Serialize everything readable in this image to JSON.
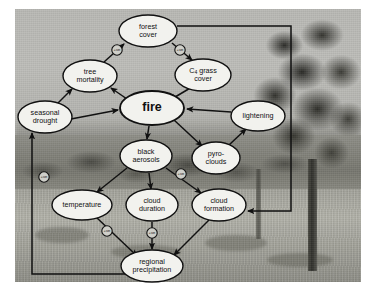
{
  "figure": {
    "kind": "causal-loop-diagram",
    "background_scene": "savanna grassland with tree",
    "central_node": "fire"
  },
  "colors": {
    "node_fill": "#f2f2ee",
    "node_stroke": "#111111",
    "arrow": "#111111",
    "badge_fill": "#cfcfc9",
    "text": "#101010",
    "photo_base": "#a9a9a6"
  },
  "nodes": [
    {
      "id": "forest_cover",
      "label_lines": [
        "forest",
        "cover"
      ],
      "cx": 148,
      "cy": 31,
      "rx": 29,
      "ry": 16,
      "font": 7.2,
      "bold": false
    },
    {
      "id": "c4_grass_cover",
      "label_lines": [
        "C₄ grass",
        "cover"
      ],
      "cx": 203,
      "cy": 75,
      "rx": 28,
      "ry": 16,
      "font": 7.2,
      "bold": false
    },
    {
      "id": "tree_mortality",
      "label_lines": [
        "tree",
        "mortality"
      ],
      "cx": 90,
      "cy": 76,
      "rx": 27,
      "ry": 16,
      "font": 7.2,
      "bold": false
    },
    {
      "id": "fire",
      "label_lines": [
        "fire"
      ],
      "cx": 152,
      "cy": 108,
      "rx": 32,
      "ry": 17,
      "font": 12.5,
      "bold": true
    },
    {
      "id": "seasonal_drought",
      "label_lines": [
        "seasonal",
        "drought"
      ],
      "cx": 45,
      "cy": 117,
      "rx": 27,
      "ry": 16,
      "font": 7.2,
      "bold": false
    },
    {
      "id": "lightening",
      "label_lines": [
        "lightening"
      ],
      "cx": 258,
      "cy": 116,
      "rx": 27,
      "ry": 15,
      "font": 7.2,
      "bold": false
    },
    {
      "id": "black_aerosols",
      "label_lines": [
        "black",
        "aerosols"
      ],
      "cx": 146,
      "cy": 156,
      "rx": 26,
      "ry": 16,
      "font": 7.2,
      "bold": false
    },
    {
      "id": "pyro_clouds",
      "label_lines": [
        "pyro-",
        "clouds"
      ],
      "cx": 216,
      "cy": 158,
      "rx": 24,
      "ry": 16,
      "font": 7.2,
      "bold": false
    },
    {
      "id": "temperature",
      "label_lines": [
        "temperature"
      ],
      "cx": 82,
      "cy": 205,
      "rx": 30,
      "ry": 15,
      "font": 7.2,
      "bold": false
    },
    {
      "id": "cloud_duration",
      "label_lines": [
        "cloud",
        "duration"
      ],
      "cx": 152,
      "cy": 205,
      "rx": 26,
      "ry": 16,
      "font": 7.2,
      "bold": false
    },
    {
      "id": "cloud_formation",
      "label_lines": [
        "cloud",
        "formation"
      ],
      "cx": 219,
      "cy": 205,
      "rx": 27,
      "ry": 16,
      "font": 7.2,
      "bold": false
    },
    {
      "id": "regional_precipitation",
      "label_lines": [
        "regional",
        "precipitation"
      ],
      "cx": 152,
      "cy": 266,
      "rx": 31,
      "ry": 16,
      "font": 7.2,
      "bold": false
    }
  ],
  "badges": [
    {
      "id": "badge_tree_mortality_forest_cover",
      "label": "+ve",
      "cx": 117,
      "cy": 50
    },
    {
      "id": "badge_forest_cover_c4_grass",
      "label": "+ve",
      "cx": 180,
      "cy": 50
    },
    {
      "id": "badge_precipitation_drought",
      "label": "+ve",
      "cx": 44,
      "cy": 177
    },
    {
      "id": "badge_black_aerosols_cloud",
      "label": "+ve",
      "cx": 181,
      "cy": 174
    },
    {
      "id": "badge_temperature_precipitation",
      "label": "+ve",
      "cx": 107,
      "cy": 231
    },
    {
      "id": "badge_cloud_duration_precip",
      "label": "+ve",
      "cx": 152,
      "cy": 233
    }
  ],
  "edges": [
    {
      "id": "edge_tree_mortality_to_forest_cover",
      "from": "tree_mortality",
      "to": "forest_cover"
    },
    {
      "id": "edge_forest_cover_to_c4_grass",
      "from": "forest_cover",
      "to": "c4_grass_cover"
    },
    {
      "id": "edge_c4_grass_to_fire",
      "from": "c4_grass_cover",
      "to": "fire"
    },
    {
      "id": "edge_fire_to_tree_mortality",
      "from": "fire",
      "to": "tree_mortality"
    },
    {
      "id": "edge_seasonal_drought_to_tree_mortality",
      "from": "seasonal_drought",
      "to": "tree_mortality"
    },
    {
      "id": "edge_seasonal_drought_to_fire",
      "from": "seasonal_drought",
      "to": "fire"
    },
    {
      "id": "edge_lightening_to_fire",
      "from": "lightening",
      "to": "fire"
    },
    {
      "id": "edge_fire_to_black_aerosols",
      "from": "fire",
      "to": "black_aerosols"
    },
    {
      "id": "edge_fire_to_pyro_clouds",
      "from": "fire",
      "to": "pyro_clouds"
    },
    {
      "id": "edge_pyro_clouds_to_lightening",
      "from": "pyro_clouds",
      "to": "lightening"
    },
    {
      "id": "edge_black_aerosols_to_temperature",
      "from": "black_aerosols",
      "to": "temperature"
    },
    {
      "id": "edge_black_aerosols_to_cloud_duration",
      "from": "black_aerosols",
      "to": "cloud_duration"
    },
    {
      "id": "edge_black_aerosols_to_cloud_formation",
      "from": "black_aerosols",
      "to": "cloud_formation"
    },
    {
      "id": "edge_temperature_to_precipitation",
      "from": "temperature",
      "to": "regional_precipitation"
    },
    {
      "id": "edge_cloud_duration_to_precipitation",
      "from": "cloud_duration",
      "to": "regional_precipitation"
    },
    {
      "id": "edge_cloud_formation_to_precipitation",
      "from": "cloud_formation",
      "to": "regional_precipitation"
    },
    {
      "id": "edge_precipitation_to_seasonal_drought",
      "from": "regional_precipitation",
      "to": "seasonal_drought",
      "routing": "left-loop"
    },
    {
      "id": "edge_forest_cover_to_cloud_formation",
      "from": "forest_cover",
      "to": "cloud_formation",
      "routing": "right-loop"
    }
  ]
}
